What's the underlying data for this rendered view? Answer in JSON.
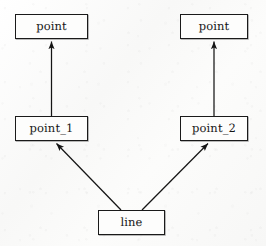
{
  "diagram": {
    "type": "class-inheritance-diagram",
    "background_color": "#fbfbfa",
    "stroke_color": "#1a1a1a",
    "node_fill_color": "#fdfdfc",
    "nodes": [
      {
        "id": "point-top-left",
        "label": "point",
        "x": 15,
        "y": 14,
        "width": 73,
        "height": 25
      },
      {
        "id": "point-top-right",
        "label": "point",
        "x": 180,
        "y": 14,
        "width": 68,
        "height": 25
      },
      {
        "id": "point-1",
        "label": "point_1",
        "x": 15,
        "y": 116,
        "width": 73,
        "height": 25
      },
      {
        "id": "point-2",
        "label": "point_2",
        "x": 180,
        "y": 116,
        "width": 68,
        "height": 25
      },
      {
        "id": "line",
        "label": "line",
        "x": 98,
        "y": 210,
        "width": 67,
        "height": 25
      }
    ],
    "edges": [
      {
        "id": "edge-point1-to-point",
        "from": "point-1",
        "to": "point-top-left",
        "arrowhead": "solid-triangle",
        "orientation": "vertical"
      },
      {
        "id": "edge-point2-to-point",
        "from": "point-2",
        "to": "point-top-right",
        "arrowhead": "solid-triangle",
        "orientation": "vertical"
      },
      {
        "id": "edge-line-to-point1",
        "from": "line",
        "to": "point-1",
        "arrowhead": "solid-triangle",
        "orientation": "diagonal-up-left"
      },
      {
        "id": "edge-line-to-point2",
        "from": "line",
        "to": "point-2",
        "arrowhead": "solid-triangle",
        "orientation": "diagonal-up-right"
      }
    ]
  }
}
